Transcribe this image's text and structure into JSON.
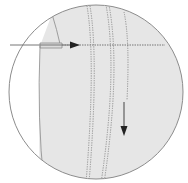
{
  "diagram": {
    "type": "sewing-detail-magnifier",
    "colors": {
      "background": "#ffffff",
      "fabric": "#e6e6e6",
      "fabric_edge": "#8a8a8a",
      "circle_outline": "#8c8c8c",
      "stitch": "#8f8f8f",
      "arrow": "#333333",
      "guide_line": "#777777"
    },
    "elements": {
      "magnifier_circle": "circle outline framing the detail view",
      "fabric_panel": "light gray fabric piece",
      "folded_flap": "folded fabric edge at left",
      "stitch_lines": [
        "stitch-line-1",
        "stitch-line-2",
        "stitch-line-3"
      ],
      "horizontal_arrow": "arrow pointing right along topstitch",
      "down_arrow": "arrow pointing downward along seam"
    }
  }
}
